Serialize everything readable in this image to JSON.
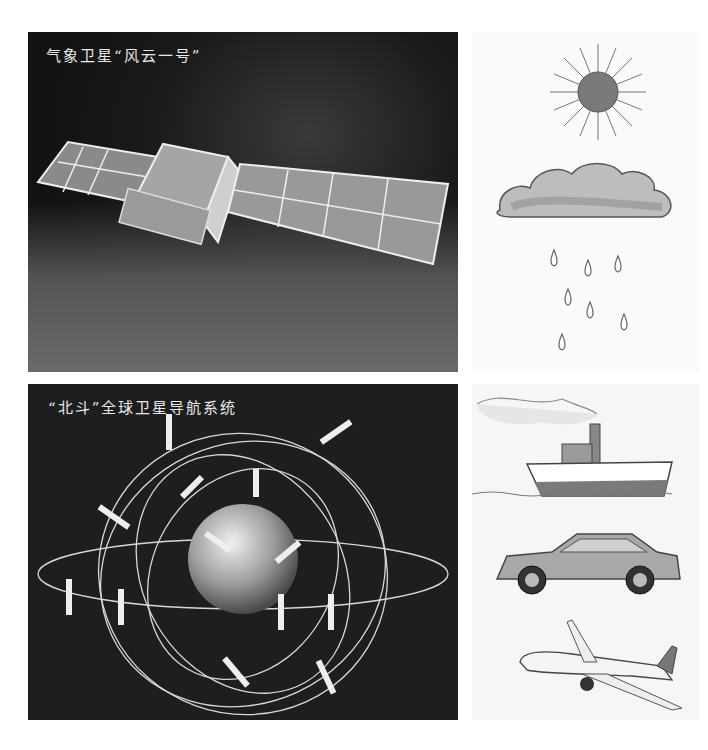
{
  "panels": {
    "weather_satellite": {
      "caption": "气象卫星“风云一号”",
      "subject": "satellite-with-solar-panels"
    },
    "beidou": {
      "caption": "“北斗”全球卫星导航系统",
      "subject": "earth-with-orbits-and-satellites"
    }
  },
  "right_column": {
    "top_group": [
      "sun",
      "cloud",
      "rain"
    ],
    "bottom_group": [
      "ship",
      "car",
      "airplane"
    ]
  },
  "bottom_text": {
    "content": "",
    "note_clipped": true
  },
  "colors": {
    "dark_bg": "#1c1c1c",
    "caption_text": "#e8e8e8",
    "orbit_line": "#d8d8d8",
    "page_bg": "#ffffff"
  }
}
